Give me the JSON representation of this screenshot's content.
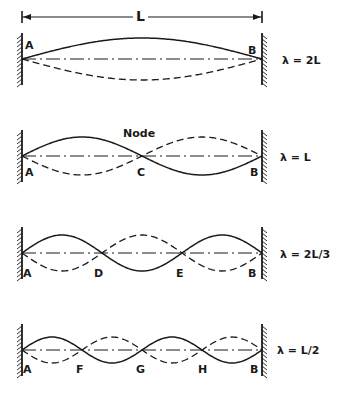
{
  "colors": {
    "ink": "#1a1a1a",
    "background": "#ffffff"
  },
  "geometry": {
    "wall_left_x": 22,
    "wall_right_x": 262
  },
  "length_marker": {
    "label": "L",
    "y": 17
  },
  "panels": [
    {
      "id": "fundamental",
      "axis_y": 59,
      "amplitude": 21,
      "loops": 1,
      "end_labels": {
        "left": "A",
        "right": "B"
      },
      "end_labels_position": "above",
      "node_labels": [],
      "wavelength_label": "λ = 2L",
      "caption": ""
    },
    {
      "id": "second-harmonic",
      "axis_y": 156,
      "amplitude": 19,
      "loops": 2,
      "end_labels": {
        "left": "A",
        "right": "B"
      },
      "end_labels_position": "below",
      "node_labels": [
        "C"
      ],
      "wavelength_label": "λ = L",
      "caption": "Node"
    },
    {
      "id": "third-harmonic",
      "axis_y": 253,
      "amplitude": 18,
      "loops": 3,
      "end_labels": {
        "left": "A",
        "right": "B"
      },
      "end_labels_position": "below",
      "node_labels": [
        "D",
        "E"
      ],
      "wavelength_label": "λ = 2L/3",
      "caption": ""
    },
    {
      "id": "fourth-harmonic",
      "axis_y": 350,
      "amplitude": 13,
      "loops": 4,
      "end_labels": {
        "left": "A",
        "right": "B"
      },
      "end_labels_position": "below",
      "node_labels": [
        "F",
        "G",
        "H"
      ],
      "wavelength_label": "λ = L/2",
      "caption": ""
    }
  ]
}
